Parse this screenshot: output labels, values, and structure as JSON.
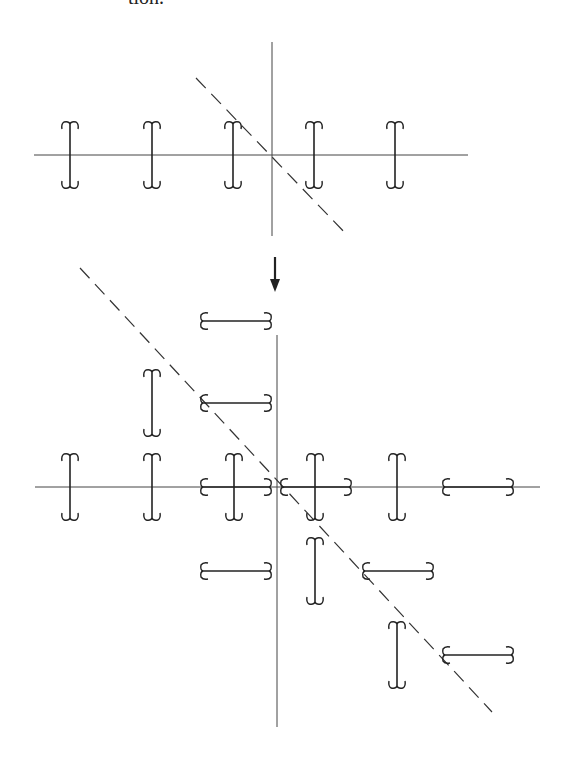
{
  "page": {
    "caption_fragment": "tion."
  },
  "diagram": {
    "colors": {
      "ink": "#222222",
      "axis": "#444444",
      "background": "#ffffff"
    },
    "top": {
      "name": "original-configuration",
      "h_axis": {
        "x1": 34,
        "x2": 468,
        "y": 155
      },
      "v_axis": {
        "x": 272,
        "y1": 42,
        "y2": 236
      },
      "dashed_line": {
        "x1": 196,
        "y1": 78,
        "x2": 348,
        "y2": 236
      },
      "vertical_brackets": [
        {
          "cx": 70,
          "cy": 155
        },
        {
          "cx": 152,
          "cy": 155
        },
        {
          "cx": 233,
          "cy": 155
        },
        {
          "cx": 314,
          "cy": 155
        },
        {
          "cx": 395,
          "cy": 155
        }
      ],
      "horizontal_brackets": []
    },
    "arrow": {
      "x": 275,
      "y1": 257,
      "y2": 292,
      "direction": "down"
    },
    "bottom": {
      "name": "transformed-configuration",
      "h_axis": {
        "x1": 35,
        "x2": 540,
        "y": 487
      },
      "v_axis": {
        "x": 277,
        "y1": 335,
        "y2": 727
      },
      "dashed_line": {
        "x1": 80,
        "y1": 268,
        "x2": 492,
        "y2": 712
      },
      "vertical_brackets": [
        {
          "cx": 70,
          "cy": 487
        },
        {
          "cx": 152,
          "cy": 487
        },
        {
          "cx": 234,
          "cy": 487
        },
        {
          "cx": 315,
          "cy": 487
        },
        {
          "cx": 397,
          "cy": 487
        },
        {
          "cx": 152,
          "cy": 403
        },
        {
          "cx": 315,
          "cy": 571
        },
        {
          "cx": 397,
          "cy": 655
        }
      ],
      "horizontal_brackets": [
        {
          "cx": 236,
          "cy": 321
        },
        {
          "cx": 236,
          "cy": 403
        },
        {
          "cx": 236,
          "cy": 487
        },
        {
          "cx": 316,
          "cy": 487
        },
        {
          "cx": 478,
          "cy": 487
        },
        {
          "cx": 236,
          "cy": 571
        },
        {
          "cx": 398,
          "cy": 571
        },
        {
          "cx": 478,
          "cy": 655
        }
      ]
    },
    "bracket_size": {
      "half_length": 31,
      "hook": 6
    }
  }
}
